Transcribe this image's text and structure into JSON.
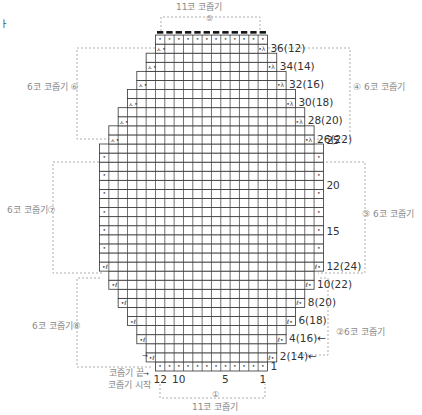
{
  "corner_mark": "ㅏ",
  "grid": {
    "origin_x": 99.5,
    "bottom_y": 371,
    "cell_w": 9.33,
    "cell_h": 9.08,
    "max_cols": 24,
    "line_color": "#333333",
    "row_widths_bottom_to_top": [
      12,
      14,
      14,
      16,
      16,
      18,
      18,
      20,
      20,
      22,
      22,
      24,
      24,
      24,
      24,
      24,
      24,
      24,
      24,
      24,
      24,
      24,
      24,
      24,
      24,
      22,
      22,
      20,
      20,
      18,
      18,
      16,
      16,
      14,
      14,
      12,
      12
    ]
  },
  "sections": [
    {
      "id": "section-1",
      "label": "11코 코줍기",
      "num": "①",
      "position": "bottom"
    },
    {
      "id": "section-2",
      "label": "6코 코줍기",
      "num": "②",
      "position": "right-lower"
    },
    {
      "id": "section-3",
      "label": "6코 코줍기",
      "num": "③",
      "position": "right-middle"
    },
    {
      "id": "section-4",
      "label": "6코 코줍기",
      "num": "④",
      "position": "right-upper"
    },
    {
      "id": "section-5",
      "label": "11코 코줍기",
      "num": "⑤",
      "position": "top"
    },
    {
      "id": "section-6",
      "label": "6코 코줍기",
      "num": "⑥",
      "position": "left-upper"
    },
    {
      "id": "section-7",
      "label": "6코 코줍기",
      "num": "⑦",
      "position": "left-middle"
    },
    {
      "id": "section-8",
      "label": "6코 코줍기",
      "num": "⑧",
      "position": "left-lower"
    }
  ],
  "labels": {
    "top": "11코 코줍기",
    "top_num": "⑤",
    "bottom": "11코 코줍기",
    "bottom_num": "①",
    "left_upper": "6코 코줍기 ⑥",
    "left_middle": "6코 코줍기⑦",
    "left_lower": "6코 코줍기⑧",
    "right_upper": "④ 6코 코줍기",
    "right_middle": "③ 6코 코줍기",
    "right_lower": "②6코 코줍기",
    "pickup_end": "코줍기 끝",
    "pickup_start": "코줍기 시작"
  },
  "row_labels": [
    {
      "text": "36(12)",
      "row": 36
    },
    {
      "text": "34(14)",
      "row": 34
    },
    {
      "text": "32(16)",
      "row": 32
    },
    {
      "text": "30(18)",
      "row": 30
    },
    {
      "text": "28(20)",
      "row": 28
    },
    {
      "text": "26(22)",
      "row": 26
    },
    {
      "text": "25",
      "row": 25
    },
    {
      "text": "20",
      "row": 20
    },
    {
      "text": "15",
      "row": 15
    },
    {
      "text": "12(24)",
      "row": 12
    },
    {
      "text": "10(22)",
      "row": 10
    },
    {
      "text": "8(20)",
      "row": 8
    },
    {
      "text": "6(18)",
      "row": 6
    },
    {
      "text": "4(16)←",
      "row": 4
    },
    {
      "text": "2(14)←",
      "row": 2
    },
    {
      "text": "1",
      "row": 1
    }
  ],
  "column_labels": [
    {
      "text": "12",
      "col": 12
    },
    {
      "text": "10",
      "col": 10
    },
    {
      "text": "5",
      "col": 5
    },
    {
      "text": "1",
      "col": 1
    }
  ],
  "symbols": {
    "pickup_dot": "•",
    "decrease_right": "λ",
    "decrease_left": "ㅅ",
    "increase_left": "ℓ",
    "increase_right": "ℓ",
    "arrow": "→",
    "bind_off": "▬"
  }
}
